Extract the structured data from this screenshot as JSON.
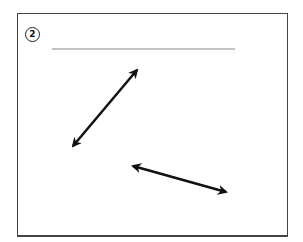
{
  "exercise": {
    "number": "2",
    "answer_line": {
      "x1": 52,
      "y1": 49,
      "x2": 235,
      "y2": 49,
      "color": "#888888"
    }
  },
  "arrows": [
    {
      "name": "double-arrow-diagonal-up",
      "x1": 73,
      "y1": 146,
      "x2": 137,
      "y2": 70,
      "color": "#111111"
    },
    {
      "name": "double-arrow-diagonal-down",
      "x1": 133,
      "y1": 166,
      "x2": 226,
      "y2": 192,
      "color": "#111111"
    }
  ]
}
